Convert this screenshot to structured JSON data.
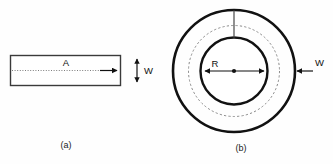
{
  "figure": {
    "background_color": "#fefefe",
    "line_color": "#111111",
    "dashed_color": "#8a8a8a",
    "panels": [
      {
        "id": "a",
        "caption": "(a)",
        "shape": "rectangle",
        "labels": {
          "length_label": "A",
          "width_label": "W"
        }
      },
      {
        "id": "b",
        "caption": "(b)",
        "shape": "annulus",
        "labels": {
          "radius_label": "R",
          "width_label": "W"
        }
      }
    ]
  },
  "panel_a": {
    "caption": "(a)",
    "axis_label": "A",
    "width_label": "W"
  },
  "panel_b": {
    "caption": "(b)",
    "radius_label": "R",
    "width_label": "W"
  }
}
